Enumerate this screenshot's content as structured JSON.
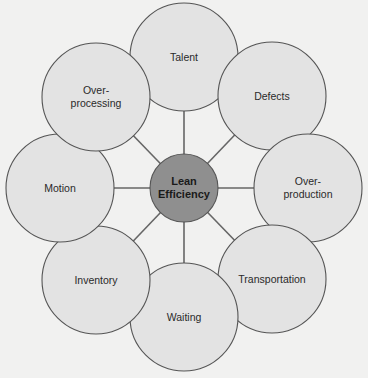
{
  "diagram": {
    "center": {
      "label": "Lean\nEfficiency",
      "x": 184,
      "y": 188,
      "r": 34,
      "fill": "#8f8f8f"
    },
    "nodes": [
      {
        "id": "talent",
        "label": "Talent",
        "x": 184,
        "y": 57,
        "r": 54
      },
      {
        "id": "defects",
        "label": "Defects",
        "x": 272,
        "y": 96,
        "r": 54
      },
      {
        "id": "over-production",
        "label": "Over-\nproduction",
        "x": 308,
        "y": 188,
        "r": 54
      },
      {
        "id": "transportation",
        "label": "Transportation",
        "x": 272,
        "y": 279,
        "r": 54
      },
      {
        "id": "waiting",
        "label": "Waiting",
        "x": 184,
        "y": 317,
        "r": 54
      },
      {
        "id": "inventory",
        "label": "Inventory",
        "x": 96,
        "y": 280,
        "r": 54
      },
      {
        "id": "motion",
        "label": "Motion",
        "x": 60,
        "y": 188,
        "r": 54
      },
      {
        "id": "over-processing",
        "label": "Over-\nprocessing",
        "x": 96,
        "y": 97,
        "r": 54
      }
    ],
    "colors": {
      "background": "#f1f1f0",
      "node_fill": "#e3e3e3",
      "stroke": "#555555",
      "spoke": "#666666"
    }
  }
}
